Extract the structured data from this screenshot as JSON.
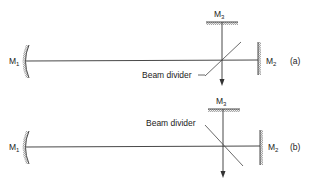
{
  "diagram": {
    "type": "interferometer-schematic",
    "colors": {
      "line": "#333333",
      "text": "#222222",
      "background": "#ffffff"
    },
    "panels": [
      {
        "id": "a",
        "tag": "(a)",
        "mirrors": {
          "m1": {
            "label": "M",
            "sub": "1",
            "shape": "concave-mirror"
          },
          "m2": {
            "label": "M",
            "sub": "2",
            "shape": "plane-mirror"
          },
          "m3": {
            "label": "M",
            "sub": "3",
            "shape": "plane-mirror"
          }
        },
        "beam_divider": {
          "label": "Beam divider",
          "orientation": "rising"
        }
      },
      {
        "id": "b",
        "tag": "(b)",
        "mirrors": {
          "m1": {
            "label": "M",
            "sub": "1",
            "shape": "concave-mirror"
          },
          "m2": {
            "label": "M",
            "sub": "2",
            "shape": "plane-mirror"
          },
          "m3": {
            "label": "M",
            "sub": "3",
            "shape": "plane-mirror"
          }
        },
        "beam_divider": {
          "label": "Beam divider",
          "orientation": "falling"
        }
      }
    ]
  }
}
